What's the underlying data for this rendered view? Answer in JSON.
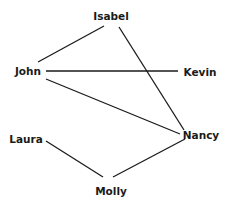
{
  "diagram": {
    "type": "graph",
    "nodes": [
      {
        "id": "isabel",
        "label": "Isabel"
      },
      {
        "id": "john",
        "label": "John"
      },
      {
        "id": "kevin",
        "label": "Kevin"
      },
      {
        "id": "laura",
        "label": "Laura"
      },
      {
        "id": "nancy",
        "label": "Nancy"
      },
      {
        "id": "molly",
        "label": "Molly"
      }
    ],
    "edges": [
      {
        "from": "Isabel",
        "to": "John"
      },
      {
        "from": "Isabel",
        "to": "Nancy"
      },
      {
        "from": "John",
        "to": "Kevin"
      },
      {
        "from": "John",
        "to": "Nancy"
      },
      {
        "from": "Laura",
        "to": "Molly"
      },
      {
        "from": "Molly",
        "to": "Nancy"
      }
    ],
    "colors": {
      "ink": "#1a1a1a",
      "background": "#ffffff"
    }
  }
}
